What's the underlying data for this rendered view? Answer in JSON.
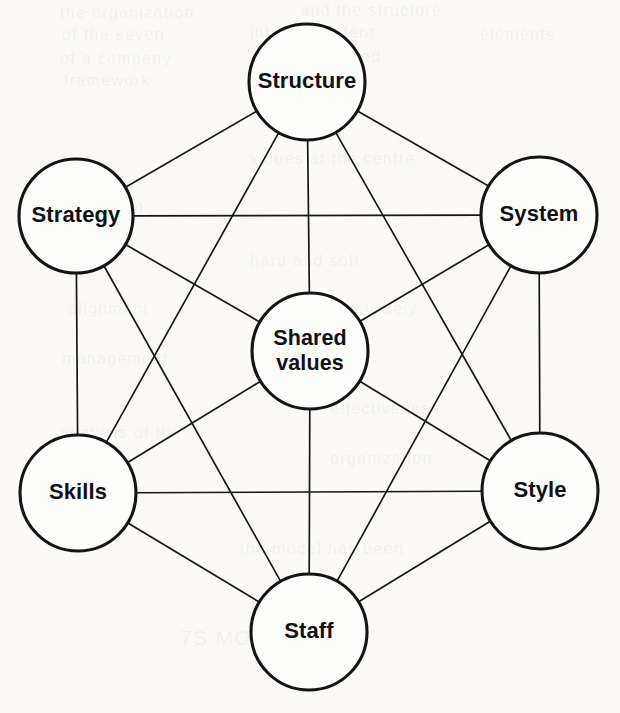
{
  "figure": {
    "name": "McKinsey 7-S Framework diagram",
    "background_color": "#fbfaf7",
    "line_color": "#17171a",
    "circle_fill": "#fdfdfb",
    "text_color": "#111114"
  },
  "nodes": [
    {
      "id": "structure",
      "label": "Structure",
      "cx": 307,
      "cy": 82,
      "r": 58,
      "lines": [
        "Structure"
      ]
    },
    {
      "id": "strategy",
      "label": "Strategy",
      "cx": 76,
      "cy": 216,
      "r": 57,
      "lines": [
        "Strategy"
      ]
    },
    {
      "id": "system",
      "label": "System",
      "cx": 539,
      "cy": 215,
      "r": 58,
      "lines": [
        "System"
      ]
    },
    {
      "id": "shared-values",
      "label": "Shared values",
      "cx": 310,
      "cy": 351,
      "r": 58,
      "lines": [
        "Shared",
        "values"
      ]
    },
    {
      "id": "skills",
      "label": "Skills",
      "cx": 78,
      "cy": 493,
      "r": 58,
      "lines": [
        "Skills"
      ]
    },
    {
      "id": "style",
      "label": "Style",
      "cx": 540,
      "cy": 491,
      "r": 58,
      "lines": [
        "Style"
      ]
    },
    {
      "id": "staff",
      "label": "Staff",
      "cx": 309,
      "cy": 632,
      "r": 58,
      "lines": [
        "Staff"
      ]
    }
  ],
  "edges": [
    {
      "from": "shared-values",
      "to": "structure"
    },
    {
      "from": "shared-values",
      "to": "strategy"
    },
    {
      "from": "shared-values",
      "to": "system"
    },
    {
      "from": "shared-values",
      "to": "skills"
    },
    {
      "from": "shared-values",
      "to": "style"
    },
    {
      "from": "shared-values",
      "to": "staff"
    },
    {
      "from": "structure",
      "to": "strategy"
    },
    {
      "from": "structure",
      "to": "system"
    },
    {
      "from": "structure",
      "to": "skills"
    },
    {
      "from": "structure",
      "to": "style"
    },
    {
      "from": "strategy",
      "to": "system"
    },
    {
      "from": "strategy",
      "to": "skills"
    },
    {
      "from": "strategy",
      "to": "staff"
    },
    {
      "from": "system",
      "to": "style"
    },
    {
      "from": "system",
      "to": "staff"
    },
    {
      "from": "skills",
      "to": "style"
    },
    {
      "from": "skills",
      "to": "staff"
    },
    {
      "from": "style",
      "to": "staff"
    }
  ],
  "bleed_text": [
    {
      "text": "the organization",
      "x": 60,
      "y": 4,
      "size": 16
    },
    {
      "text": "and the structure",
      "x": 300,
      "y": 2,
      "size": 16
    },
    {
      "text": "of the seven",
      "x": 62,
      "y": 26,
      "size": 16
    },
    {
      "text": "interdependent",
      "x": 250,
      "y": 24,
      "size": 16
    },
    {
      "text": "elements",
      "x": 480,
      "y": 26,
      "size": 16
    },
    {
      "text": "of a company",
      "x": 60,
      "y": 50,
      "size": 16
    },
    {
      "text": "described",
      "x": 300,
      "y": 48,
      "size": 16
    },
    {
      "text": "framework",
      "x": 64,
      "y": 72,
      "size": 16
    },
    {
      "text": "values at the centre",
      "x": 250,
      "y": 150,
      "size": 16
    },
    {
      "text": "the model",
      "x": 62,
      "y": 200,
      "size": 16
    },
    {
      "text": "hard and soft",
      "x": 250,
      "y": 252,
      "size": 16
    },
    {
      "text": "alignment",
      "x": 68,
      "y": 300,
      "size": 16
    },
    {
      "text": "is used widely",
      "x": 300,
      "y": 300,
      "size": 16
    },
    {
      "text": "management",
      "x": 62,
      "y": 350,
      "size": 16
    },
    {
      "text": "effectiveness",
      "x": 330,
      "y": 400,
      "size": 16
    },
    {
      "text": "analysis of the",
      "x": 60,
      "y": 424,
      "size": 16
    },
    {
      "text": "organization",
      "x": 330,
      "y": 450,
      "size": 16
    },
    {
      "text": "change",
      "x": 62,
      "y": 500,
      "size": 16
    },
    {
      "text": "the model has been",
      "x": 240,
      "y": 540,
      "size": 16
    },
    {
      "text": "7S MODEL",
      "x": 180,
      "y": 626,
      "size": 21
    }
  ]
}
